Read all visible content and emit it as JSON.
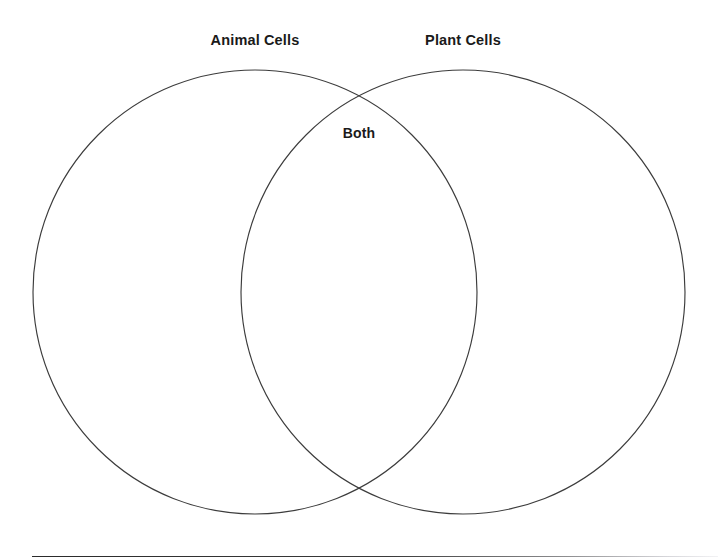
{
  "diagram": {
    "type": "venn",
    "title_left": "Animal Cells",
    "title_right": "Plant Cells",
    "overlap_label": "Both",
    "set_count": 2,
    "stroke_color": "#3c3c3c",
    "fill_color": "#ffffff",
    "background_color": "#ffffff",
    "text_color": "#1a1a1a",
    "left_circle": {
      "cx": 255,
      "cy": 292,
      "r": 222
    },
    "right_circle": {
      "cx": 463,
      "cy": 292,
      "r": 222
    },
    "intersection_points": [
      {
        "x": 359,
        "y": 90
      },
      {
        "x": 359,
        "y": 494
      }
    ],
    "regions": [
      {
        "name": "left-only",
        "label": "Animal Cells",
        "items": []
      },
      {
        "name": "intersection",
        "label": "Both",
        "items": []
      },
      {
        "name": "right-only",
        "label": "Plant Cells",
        "items": []
      }
    ]
  },
  "footer": {
    "rule_color": "#2b2b2b"
  }
}
